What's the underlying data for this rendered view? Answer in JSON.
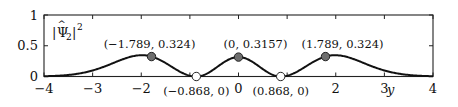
{
  "chart_data": {
    "type": "line",
    "title": "",
    "xlabel": "y",
    "ylabel": "|Ψ̂₂|²",
    "xlim": [
      -4,
      4
    ],
    "ylim": [
      0,
      1
    ],
    "grid": false,
    "x_ticks": [
      -4,
      -3,
      -2,
      -1,
      0,
      1,
      2,
      3,
      4
    ],
    "x_tick_labels": [
      "−4",
      "−3",
      "−2",
      "",
      "0",
      "",
      "2",
      "3",
      "4"
    ],
    "y_ticks": [
      0,
      0.5,
      1
    ],
    "y_tick_labels": [
      "0",
      "0.5",
      "1"
    ],
    "series": [
      {
        "name": "|Ψ̂₂|²",
        "color": "#111111",
        "description": "Squared modulus of second eigenfunction: three humps with maxima at y=−1.789, 0, 1.789 and zeros at y=±0.868",
        "x": [
          -4,
          -3.5,
          -3,
          -2.75,
          -2.5,
          -2.25,
          -2,
          -1.789,
          -1.5,
          -1.25,
          -1,
          -0.868,
          -0.75,
          -0.5,
          -0.25,
          0,
          0.25,
          0.5,
          0.75,
          0.868,
          1,
          1.25,
          1.5,
          1.789,
          2,
          2.25,
          2.5,
          2.75,
          3,
          3.5,
          4
        ],
        "y": [
          0,
          0.0003,
          0.006,
          0.025,
          0.085,
          0.18,
          0.28,
          0.324,
          0.27,
          0.13,
          0.02,
          0,
          0.02,
          0.14,
          0.27,
          0.3157,
          0.27,
          0.14,
          0.02,
          0,
          0.02,
          0.13,
          0.27,
          0.324,
          0.28,
          0.18,
          0.085,
          0.025,
          0.006,
          0.0003,
          0
        ]
      }
    ],
    "markers": [
      {
        "x": -1.789,
        "y": 0.324,
        "style": "filled",
        "fill": "#6e6e6e",
        "label": "(−1.789, 0.324)"
      },
      {
        "x": 0,
        "y": 0.3157,
        "style": "filled",
        "fill": "#6e6e6e",
        "label": "(0, 0.3157)"
      },
      {
        "x": 1.789,
        "y": 0.324,
        "style": "filled",
        "fill": "#6e6e6e",
        "label": "(1.789, 0.324)"
      },
      {
        "x": -0.868,
        "y": 0,
        "style": "hollow",
        "fill": "#ffffff",
        "label": "(−0.868, 0)"
      },
      {
        "x": 0.868,
        "y": 0,
        "style": "hollow",
        "fill": "#ffffff",
        "label": "(0.868, 0)"
      }
    ],
    "legend": null
  },
  "labels": {
    "ylabel_main": "|Ψ",
    "ylabel_sub": "2",
    "ylabel_tail": "|",
    "ylabel_sup": "2",
    "ylabel_hat": "^",
    "xlabel": "y"
  }
}
